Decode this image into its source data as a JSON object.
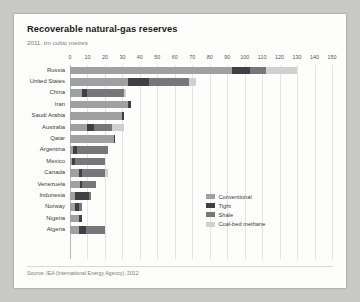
{
  "title": "Recoverable natural-gas reserves",
  "subtitle": "2011, trn cubic metres",
  "source": "Source: IEA (International Energy Agency), 2012",
  "colors": {
    "conventional": "#9fa0a2",
    "tight": "#3f4044",
    "shale": "#76777b",
    "coalbed": "#cfd0cf",
    "card": "#fdfdfb",
    "grid": "#e4e4e0",
    "axis_text": "#56565a"
  },
  "legend": {
    "position": "bottom-right",
    "items": [
      {
        "label": "Conventional",
        "key": "conventional"
      },
      {
        "label": "Tight",
        "key": "tight"
      },
      {
        "label": "Shale",
        "key": "shale"
      },
      {
        "label": "Coal-bed methane",
        "key": "coalbed"
      }
    ]
  },
  "chart_data": {
    "type": "bar",
    "orientation": "horizontal",
    "stacked": true,
    "title": "Recoverable natural-gas reserves",
    "subtitle": "2011, trn cubic metres",
    "xlabel": "",
    "ylabel": "",
    "xlim": [
      0,
      150
    ],
    "xticks": [
      0,
      10,
      20,
      30,
      40,
      50,
      60,
      70,
      80,
      90,
      100,
      110,
      120,
      130,
      140,
      150
    ],
    "grid": true,
    "categories": [
      "Russia",
      "United States",
      "China",
      "Iran",
      "Saudi Arabia",
      "Australia",
      "Qatar",
      "Argentina",
      "Mexico",
      "Canada",
      "Venezuela",
      "Indonesia",
      "Norway",
      "Nigeria",
      "Algeria"
    ],
    "series": [
      {
        "name": "Conventional",
        "values": [
          93,
          33,
          7,
          33,
          30,
          10,
          25,
          2,
          1,
          5,
          6,
          3,
          3,
          5,
          5
        ]
      },
      {
        "name": "Tight",
        "values": [
          10,
          12,
          3,
          2,
          1,
          4,
          1,
          2,
          2,
          2,
          1,
          8,
          2,
          2,
          4
        ]
      },
      {
        "name": "Shale",
        "values": [
          9,
          23,
          21,
          0,
          0,
          10,
          0,
          18,
          17,
          13,
          8,
          1,
          2,
          0,
          11
        ]
      },
      {
        "name": "Coal-bed methane",
        "values": [
          18,
          4,
          1,
          0,
          0,
          7,
          0,
          0,
          0,
          2,
          0,
          0,
          0,
          0,
          0
        ]
      }
    ],
    "totals": [
      130,
      72,
      32,
      35,
      31,
      31,
      26,
      22,
      20,
      22,
      15,
      12,
      7,
      7,
      20
    ]
  }
}
